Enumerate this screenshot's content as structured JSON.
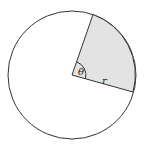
{
  "diagram": {
    "labels": {
      "angle": "θ",
      "radius": "r"
    },
    "colors": {
      "sector_fill": "#e3e3e3",
      "stroke": "#333333",
      "background": "#ffffff"
    }
  }
}
